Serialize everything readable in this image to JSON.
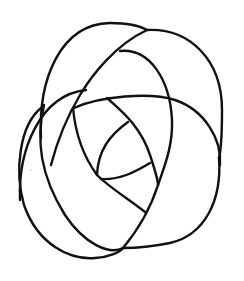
{
  "figure": {
    "type": "knot-line-drawing",
    "width": 244,
    "height": 281,
    "stroke_color": "#111111",
    "background": "#ffffff",
    "strokes": [
      {
        "id": "top-left-arch",
        "d": "M 41 138 C 38 80, 60 24, 110 23 C 128 23, 140 26, 147 30"
      },
      {
        "id": "top-right-outer",
        "d": "M 147 30 C 190 28, 222 60, 222 110 C 222 135, 221 150, 219 158"
      },
      {
        "id": "inner-diagonal-long",
        "d": "M 147 30 C 115 45, 92 75, 80 95 C 68 115, 58 138, 51 165"
      },
      {
        "id": "inner-top-arc",
        "d": "M 120 51 C 150 48, 170 80, 172 120 C 173 145, 165 165, 158 185"
      },
      {
        "id": "left-mid-arc",
        "d": "M 20 200 C 18 150, 40 95, 86 90"
      },
      {
        "id": "center-arc-wide",
        "d": "M 74 108 C 100 96, 150 92, 175 100 C 205 110, 222 140, 220 165"
      },
      {
        "id": "left-loop-big",
        "d": "M 44 105 C 36 140, 40 175, 65 215 C 85 245, 110 255, 123 248"
      },
      {
        "id": "far-left-outer",
        "d": "M 41 108 C 20 125, 14 170, 24 205 C 38 245, 70 260, 95 258 C 110 257, 120 252, 123 248"
      },
      {
        "id": "inner-left-curve",
        "d": "M 73 108 C 76 140, 86 160, 97 175 C 110 188, 130 200, 145 212"
      },
      {
        "id": "center-spoke",
        "d": "M 107 98 C 120 110, 140 125, 150 155 C 155 170, 158 180, 158 185"
      },
      {
        "id": "petal-inner-left",
        "d": "M 128 122 C 110 135, 98 150, 97 175"
      },
      {
        "id": "petal-inner-bottom",
        "d": "M 101 179 C 120 180, 135 172, 150 163"
      },
      {
        "id": "bottom-diagonal",
        "d": "M 158 185 C 150 210, 138 230, 123 248"
      },
      {
        "id": "bottom-right-outer",
        "d": "M 219 158 C 222 200, 205 235, 170 243 C 150 247, 135 248, 123 248"
      }
    ],
    "artifact_dot": {
      "cx": 31,
      "cy": 170,
      "r": 0.8
    }
  }
}
